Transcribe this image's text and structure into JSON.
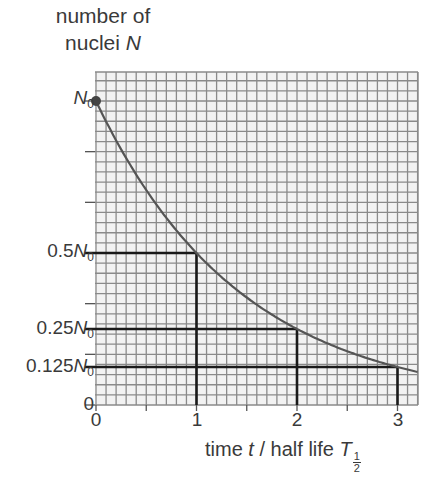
{
  "chart_data": {
    "type": "line",
    "title": "",
    "xlabel": "time t / half life T1/2",
    "ylabel": "number of nuclei N",
    "xlim": [
      0,
      3.2
    ],
    "ylim": [
      0,
      1.1
    ],
    "grid": true,
    "x_ticks": [
      0,
      1,
      2,
      3
    ],
    "x_tick_labels": [
      "0",
      "1",
      "2",
      "3"
    ],
    "y_ticks": [
      0,
      0.125,
      0.25,
      0.5,
      1
    ],
    "y_tick_labels": [
      "0",
      "0.125N0",
      "0.25N0",
      "0.5N0",
      "N0"
    ],
    "series": [
      {
        "name": "N = N0 (1/2)^(t/T1/2)",
        "x": [
          0,
          0.5,
          1,
          1.5,
          2,
          2.5,
          3,
          3.2
        ],
        "values": [
          1,
          0.707,
          0.5,
          0.354,
          0.25,
          0.177,
          0.125,
          0.109
        ]
      }
    ],
    "annotations": [
      {
        "x": 1,
        "y": 0.5,
        "label": "0.5N0"
      },
      {
        "x": 2,
        "y": 0.25,
        "label": "0.25N0"
      },
      {
        "x": 3,
        "y": 0.125,
        "label": "0.125N0"
      }
    ],
    "start_marker": {
      "x": 0,
      "y": 1,
      "label": "N0"
    }
  },
  "labels": {
    "ylabel_line1": "number of",
    "ylabel_line2_text": "nuclei ",
    "ylabel_line2_var": "N",
    "xlabel_prefix": "time ",
    "xlabel_var": "t",
    "xlabel_mid": " / half life ",
    "xlabel_T": "T",
    "frac_num": "1",
    "frac_den": "2",
    "yt_n0_var": "N",
    "yt_n0_sub": "0",
    "yt_half_coef": "0.5",
    "yt_quarter_coef": "0.25",
    "yt_eighth_coef": "0.125",
    "yt_zero": "0",
    "xt0": "0",
    "xt1": "1",
    "xt2": "2",
    "xt3": "3"
  },
  "colors": {
    "grid_minor": "#8a8a8a",
    "grid_bg": "#f2f2f2",
    "curve": "#555555",
    "guides": "#1a1a1a",
    "text": "#3a3a3a"
  }
}
